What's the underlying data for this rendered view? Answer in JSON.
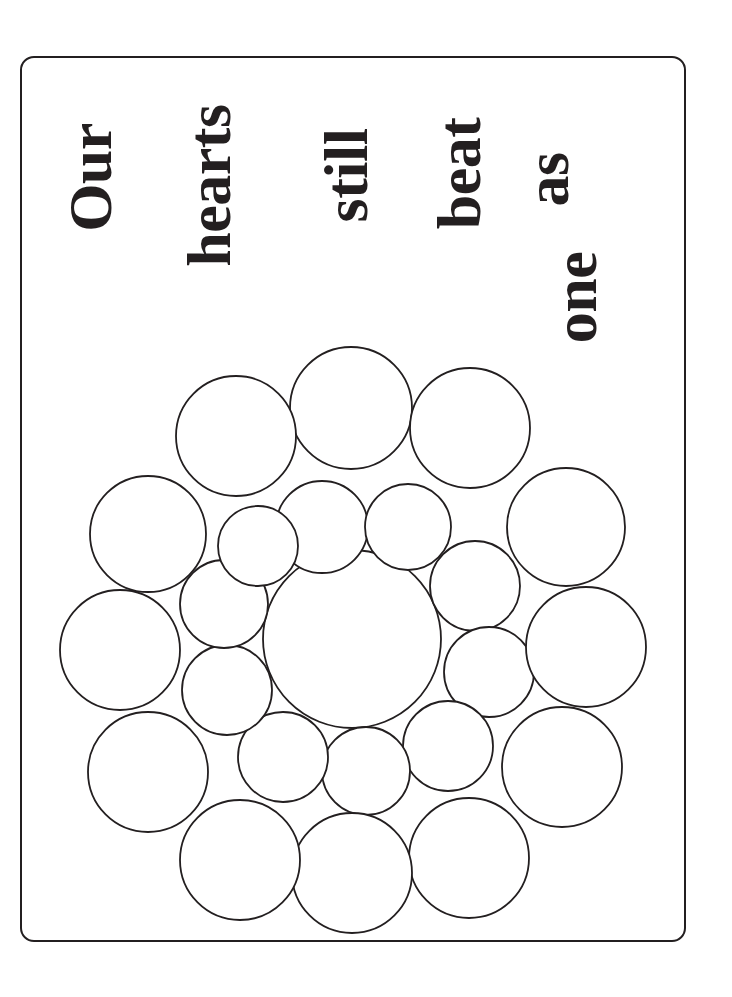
{
  "card": {
    "title": "Our hearts still beat as one",
    "orientation": "text rotated 90 degrees counter-clockwise",
    "border_color": "#231f20",
    "background_color": "#ffffff",
    "ink_color": "#231f20"
  },
  "greeting": {
    "full_text": "Our hearts still beat as one",
    "words": [
      {
        "text": "Our"
      },
      {
        "text": "hearts"
      },
      {
        "text": "still"
      },
      {
        "text": "beat"
      },
      {
        "text": "as"
      },
      {
        "text": "one"
      }
    ]
  },
  "artwork": {
    "name": "circle-mandala",
    "description": "Coloring-page mandala built from tangent circles",
    "stroke_color": "#231f20",
    "fill_color": "#ffffff",
    "stroke_width": 1.8,
    "center": {
      "cx": 352,
      "cy": 639
    },
    "circles": [
      {
        "id": "center",
        "cx": 352,
        "cy": 639,
        "r": 89
      },
      {
        "id": "inner-1",
        "cx": 322,
        "cy": 527,
        "r": 46
      },
      {
        "id": "inner-2",
        "cx": 408,
        "cy": 527,
        "r": 43
      },
      {
        "id": "inner-3",
        "cx": 475,
        "cy": 586,
        "r": 45
      },
      {
        "id": "inner-4",
        "cx": 489,
        "cy": 672,
        "r": 45
      },
      {
        "id": "inner-5",
        "cx": 448,
        "cy": 746,
        "r": 45
      },
      {
        "id": "inner-6",
        "cx": 366,
        "cy": 771,
        "r": 44
      },
      {
        "id": "inner-7",
        "cx": 283,
        "cy": 757,
        "r": 45
      },
      {
        "id": "inner-8",
        "cx": 227,
        "cy": 690,
        "r": 45
      },
      {
        "id": "inner-9",
        "cx": 224,
        "cy": 604,
        "r": 44
      },
      {
        "id": "inner-10",
        "cx": 258,
        "cy": 546,
        "r": 40
      },
      {
        "id": "outer-1",
        "cx": 351,
        "cy": 408,
        "r": 61
      },
      {
        "id": "outer-2",
        "cx": 470,
        "cy": 428,
        "r": 60
      },
      {
        "id": "outer-3",
        "cx": 566,
        "cy": 527,
        "r": 59
      },
      {
        "id": "outer-4",
        "cx": 586,
        "cy": 647,
        "r": 60
      },
      {
        "id": "outer-5",
        "cx": 562,
        "cy": 767,
        "r": 60
      },
      {
        "id": "outer-6",
        "cx": 469,
        "cy": 858,
        "r": 60
      },
      {
        "id": "outer-7",
        "cx": 352,
        "cy": 873,
        "r": 60
      },
      {
        "id": "outer-8",
        "cx": 240,
        "cy": 860,
        "r": 60
      },
      {
        "id": "outer-9",
        "cx": 148,
        "cy": 772,
        "r": 60
      },
      {
        "id": "outer-10",
        "cx": 120,
        "cy": 650,
        "r": 60
      },
      {
        "id": "outer-11",
        "cx": 148,
        "cy": 534,
        "r": 58
      },
      {
        "id": "outer-12",
        "cx": 236,
        "cy": 436,
        "r": 60
      }
    ]
  }
}
